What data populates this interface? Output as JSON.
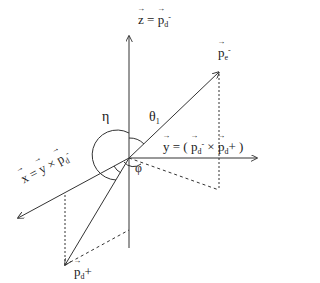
{
  "diagram": {
    "origin": [
      129,
      158
    ],
    "axes": {
      "z": {
        "label_lhs": "z",
        "eq": "=",
        "label_rhs": "p",
        "rhs_sub": "d",
        "rhs_sup": "-"
      },
      "y": {
        "label_lhs": "y",
        "eq": "= (",
        "p1": "p",
        "p1_sub": "d",
        "p1_sup": "-",
        "cross": "×",
        "p2": "p",
        "p2_sub": "d",
        "p2_sup": "+",
        "close": ")"
      },
      "x": {
        "label_lhs": "x",
        "eq": "=",
        "y": "y",
        "cross": "×",
        "p": "p",
        "p_sub": "d",
        "p_sup": "-"
      }
    },
    "vectors": {
      "pe": {
        "base": "p",
        "sub": "e",
        "sup": "-"
      },
      "pd_plus": {
        "base": "p",
        "sub": "d",
        "sup": "+"
      }
    },
    "angles": {
      "eta": "η",
      "theta": "θ",
      "theta_sub": "1",
      "phi": "φ"
    },
    "colors": {
      "stroke": "#333333",
      "text": "#222222",
      "background": "#ffffff"
    }
  }
}
